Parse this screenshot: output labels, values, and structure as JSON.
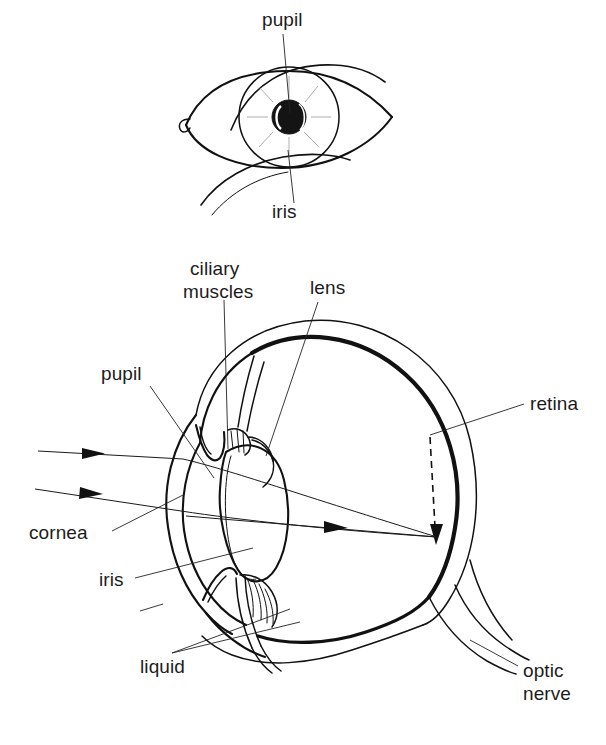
{
  "figure": {
    "background_color": "#ffffff",
    "ink_color": "#111111",
    "label_color": "#1c1c1c"
  },
  "top_diagram": {
    "name": "external-eye-view",
    "labels": [
      {
        "id": "pupil",
        "text": "pupil",
        "x": 262,
        "y": 26,
        "anchor": "start"
      },
      {
        "id": "iris",
        "text": "iris",
        "x": 272,
        "y": 218,
        "anchor": "start"
      }
    ]
  },
  "bottom_diagram": {
    "name": "eye-cross-section",
    "labels": [
      {
        "id": "ciliary-muscles",
        "text_line1": "ciliary",
        "text_line2": "muscles",
        "x": 190,
        "y": 275,
        "anchor": "start"
      },
      {
        "id": "lens",
        "text": "lens",
        "x": 310,
        "y": 293,
        "anchor": "start"
      },
      {
        "id": "pupil",
        "text": "pupil",
        "x": 101,
        "y": 379,
        "anchor": "start"
      },
      {
        "id": "retina",
        "text": "retina",
        "x": 528,
        "y": 409,
        "anchor": "start"
      },
      {
        "id": "cornea",
        "text": "cornea",
        "x": 30,
        "y": 540,
        "anchor": "start"
      },
      {
        "id": "iris",
        "text": "iris",
        "x": 98,
        "y": 585,
        "anchor": "start"
      },
      {
        "id": "liquid",
        "text": "liquid",
        "x": 140,
        "y": 672,
        "anchor": "start"
      },
      {
        "id": "optic-nerve",
        "text_line1": "optic",
        "text_line2": "nerve",
        "x": 523,
        "y": 676,
        "anchor": "start"
      }
    ],
    "light_rays": [
      {
        "id": "ray-upper",
        "description": "upper parallel incident ray entering cornea, refracted to retina"
      },
      {
        "id": "ray-lower",
        "description": "lower parallel incident ray entering cornea, refracted to retina"
      },
      {
        "id": "ray-axis",
        "description": "central axial ray through pupil and lens to retina"
      }
    ],
    "image_arrow": {
      "id": "inverted-image-arrow",
      "style": "dashed",
      "description": "dashed arrow on retina showing the inverted image"
    }
  }
}
